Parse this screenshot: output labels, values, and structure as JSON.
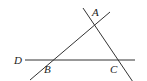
{
  "diagram": {
    "type": "geometry",
    "stroke_color": "#333333",
    "background": "#ffffff",
    "points": {
      "A": {
        "label": "A",
        "x": 93,
        "y": 22
      },
      "B": {
        "label": "B",
        "x": 45,
        "y": 60
      },
      "C": {
        "label": "C",
        "x": 120,
        "y": 60
      },
      "D": {
        "label": "D",
        "x": 26,
        "y": 60
      }
    },
    "lines": [
      {
        "name": "line-AB",
        "x1": 30,
        "y1": 80,
        "x2": 110,
        "y2": 12
      },
      {
        "name": "line-AC",
        "x1": 83,
        "y1": 8,
        "x2": 133,
        "y2": 82
      },
      {
        "name": "line-DC",
        "x1": 25,
        "y1": 60,
        "x2": 135,
        "y2": 60
      }
    ],
    "labels": {
      "A": "A",
      "B": "B",
      "C": "C",
      "D": "D"
    }
  }
}
